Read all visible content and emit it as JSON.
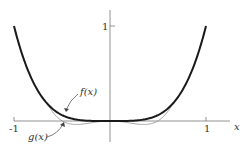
{
  "chart_data": {
    "type": "line",
    "title": "",
    "xlabel": "x",
    "ylabel": "",
    "xlim": [
      -1,
      1
    ],
    "ylim": [
      -0.1,
      1.1
    ],
    "x_ticks": [
      {
        "value": -1,
        "label": "-1"
      },
      {
        "value": 1,
        "label": "1"
      }
    ],
    "y_ticks": [
      {
        "value": 1,
        "label": "1"
      }
    ],
    "grid": false,
    "legend": "none",
    "series": [
      {
        "name": "f(x)",
        "style": "thick dark",
        "formula_estimate": "x^4",
        "x": [
          -1,
          -0.8,
          -0.6,
          -0.4,
          -0.2,
          0,
          0.2,
          0.4,
          0.6,
          0.8,
          1
        ],
        "values": [
          1,
          0.41,
          0.13,
          0.026,
          0.002,
          0,
          0.002,
          0.026,
          0.13,
          0.41,
          1
        ]
      },
      {
        "name": "g(x)",
        "style": "thin gray",
        "formula_estimate": "approx x^4 with dips below 0 near x=±0.4",
        "x": [
          -1,
          -0.8,
          -0.6,
          -0.4,
          -0.2,
          0,
          0.2,
          0.4,
          0.6,
          0.8,
          1
        ],
        "values": [
          1,
          0.41,
          0.11,
          -0.04,
          -0.02,
          0,
          -0.02,
          -0.04,
          0.11,
          0.41,
          1
        ]
      }
    ],
    "annotations": [
      {
        "text": "f(x)",
        "points_to": "f curve near x=-0.45"
      },
      {
        "text": "g(x)",
        "points_to": "g curve near x=-0.5"
      }
    ]
  },
  "labels": {
    "x_axis": "x",
    "tick_neg1": "-1",
    "tick_pos1": "1",
    "y_tick_1": "1",
    "f_label": "f(x)",
    "g_label": "g(x)"
  },
  "colors": {
    "f_curve": "#1a1a1a",
    "g_curve": "#9a9a9a",
    "axes": "#777777"
  }
}
